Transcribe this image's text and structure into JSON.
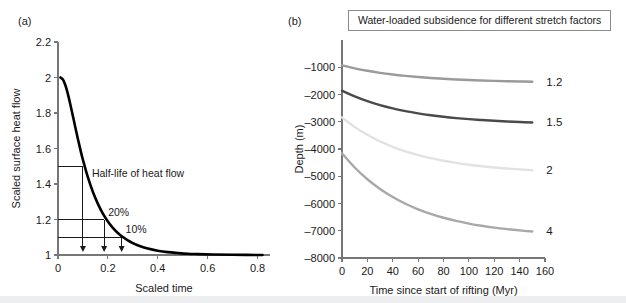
{
  "figure": {
    "panel_a_label": "(a)",
    "panel_b_label": "(b)"
  },
  "chart_data": [
    {
      "type": "line",
      "panel": "(a)",
      "title": "",
      "xlabel": "Scaled time",
      "ylabel": "Scaled surface heat flow",
      "xlim": [
        0,
        0.85
      ],
      "ylim": [
        1,
        2.2
      ],
      "xticks": [
        0,
        0.2,
        0.4,
        0.6,
        0.8
      ],
      "xticklabels": [
        "0",
        "0.2",
        "0.4",
        "0.6",
        "0.8"
      ],
      "yticks": [
        1,
        1.2,
        1.4,
        1.6,
        1.8,
        2,
        2.2
      ],
      "yticklabels": [
        "1",
        "1.2",
        "1.4",
        "1.6",
        "1.8",
        "2",
        "2.2"
      ],
      "grid": false,
      "legend": "none",
      "series": [
        {
          "name": "scaled surface heat flow",
          "color": "#000000",
          "x": [
            0.01,
            0.02,
            0.03,
            0.04,
            0.05,
            0.06,
            0.07,
            0.08,
            0.09,
            0.1,
            0.12,
            0.14,
            0.16,
            0.18,
            0.2,
            0.22,
            0.24,
            0.26,
            0.28,
            0.3,
            0.33,
            0.36,
            0.4,
            0.44,
            0.48,
            0.52,
            0.56,
            0.62,
            0.7,
            0.82
          ],
          "y": [
            2.0,
            1.988,
            1.955,
            1.905,
            1.845,
            1.781,
            1.716,
            1.652,
            1.592,
            1.536,
            1.437,
            1.355,
            1.288,
            1.233,
            1.189,
            1.153,
            1.124,
            1.101,
            1.082,
            1.067,
            1.049,
            1.036,
            1.024,
            1.016,
            1.011,
            1.007,
            1.005,
            1.003,
            1.001,
            1.0
          ]
        }
      ],
      "annotations": [
        {
          "name": "half-life-of-heat-flow",
          "text": "Half-life of heat flow",
          "y_value": 1.5,
          "x_value": 0.1
        },
        {
          "name": "twenty-percent",
          "text": "20%",
          "y_value": 1.2,
          "x_value": 0.185
        },
        {
          "name": "ten-percent",
          "text": "10%",
          "y_value": 1.1,
          "x_value": 0.255
        }
      ],
      "guide_lines": [
        {
          "level": 1.5,
          "x_drop": 0.1
        },
        {
          "level": 1.2,
          "x_drop": 0.185
        },
        {
          "level": 1.1,
          "x_drop": 0.255
        }
      ]
    },
    {
      "type": "line",
      "panel": "(b)",
      "title": "Water-loaded subsidence for different stretch factors",
      "xlabel": "Time since start of rifting (Myr)",
      "ylabel": "Depth (m)",
      "xlim": [
        0,
        160
      ],
      "ylim": [
        -8000,
        0
      ],
      "xticks": [
        0,
        20,
        40,
        60,
        80,
        100,
        120,
        140,
        160
      ],
      "xticklabels": [
        "0",
        "20",
        "40",
        "60",
        "80",
        "100",
        "120",
        "140",
        "160"
      ],
      "yticks": [
        -8000,
        -7000,
        -6000,
        -5000,
        -4000,
        -3000,
        -2000,
        -1000
      ],
      "yticklabels": [
        "–8000",
        "–7000",
        "–6000",
        "–5000",
        "–4000",
        "–3000",
        "–2000",
        "–1000"
      ],
      "grid": false,
      "legend": "right-end-labels",
      "x": [
        0,
        10,
        20,
        30,
        40,
        50,
        60,
        70,
        80,
        90,
        100,
        110,
        120,
        130,
        140,
        150
      ],
      "series": [
        {
          "name": "1.2",
          "label": "1.2",
          "color": "#9a9a9a",
          "values": [
            -930,
            -1040,
            -1130,
            -1205,
            -1265,
            -1315,
            -1358,
            -1393,
            -1423,
            -1448,
            -1468,
            -1486,
            -1500,
            -1512,
            -1522,
            -1530
          ]
        },
        {
          "name": "1.5",
          "label": "1.5",
          "color": "#4a4a4a",
          "values": [
            -1860,
            -2070,
            -2245,
            -2390,
            -2510,
            -2610,
            -2692,
            -2760,
            -2817,
            -2865,
            -2905,
            -2938,
            -2966,
            -2990,
            -3010,
            -3027
          ]
        },
        {
          "name": "2",
          "label": "2",
          "color": "#e2e2e2",
          "values": [
            -2840,
            -3190,
            -3480,
            -3720,
            -3920,
            -4086,
            -4223,
            -4337,
            -4432,
            -4511,
            -4577,
            -4632,
            -4678,
            -4717,
            -4749,
            -4777
          ]
        },
        {
          "name": "4",
          "label": "4",
          "color": "#a8a8a8",
          "values": [
            -4160,
            -4680,
            -5110,
            -5467,
            -5763,
            -6009,
            -6213,
            -6382,
            -6523,
            -6640,
            -6737,
            -6818,
            -6885,
            -6941,
            -6988,
            -7027
          ]
        }
      ]
    }
  ]
}
